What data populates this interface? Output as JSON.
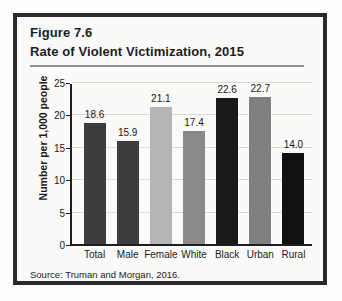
{
  "figure": {
    "number": "Figure 7.6",
    "title": "Rate of Violent Victimization, 2015",
    "source": "Source:  Truman and Morgan, 2016."
  },
  "chart_data": {
    "type": "bar",
    "title": "Rate of Violent Victimization, 2015",
    "xlabel": "",
    "ylabel": "Number per 1,000 people",
    "categories": [
      "Total",
      "Male",
      "Female",
      "White",
      "Black",
      "Urban",
      "Rural"
    ],
    "values": [
      18.6,
      15.9,
      21.1,
      17.4,
      22.6,
      22.7,
      14.0
    ],
    "value_labels": [
      "18.6",
      "15.9",
      "21.1",
      "17.4",
      "22.6",
      "22.7",
      "14.0"
    ],
    "bar_colors": [
      "#3d3d3d",
      "#3d3d3d",
      "#b5b5b5",
      "#8a8a8a",
      "#1a1a1a",
      "#7f7f7f",
      "#111111"
    ],
    "ylim": [
      0,
      25
    ],
    "yticks": [
      0,
      5,
      10,
      15,
      20,
      25
    ],
    "ytick_labels": [
      "0",
      "5",
      "10",
      "15",
      "20",
      "25"
    ],
    "grid": true,
    "legend": "none"
  },
  "colors": {
    "frame": "#2a2a2a",
    "panel_background": "#fbfaf8",
    "axis": "#1e1e1e",
    "gridline": "#d8d8d4",
    "rule": "#8e8e8e"
  }
}
